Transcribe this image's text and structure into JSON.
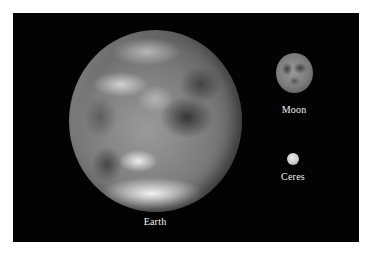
{
  "figure": {
    "background_color": "#030303",
    "frame_color": "#ffffff",
    "bodies": [
      {
        "name": "Earth",
        "label": "Earth",
        "relative_size": "large"
      },
      {
        "name": "Moon",
        "label": "Moon",
        "relative_size": "medium"
      },
      {
        "name": "Ceres",
        "label": "Ceres",
        "relative_size": "small"
      }
    ]
  }
}
